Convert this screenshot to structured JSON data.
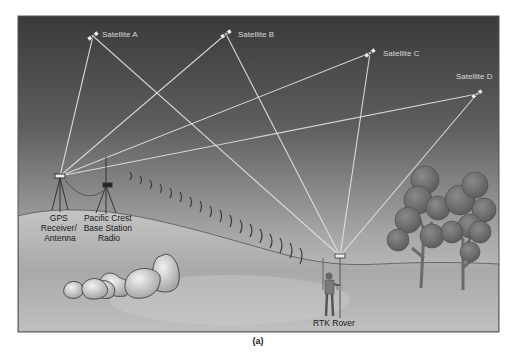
{
  "diagram": {
    "type": "RTK GPS surveying illustration",
    "caption": "(a)",
    "satellites": [
      {
        "label": "Satellite A",
        "x": 93,
        "y": 36
      },
      {
        "label": "Satellite B",
        "x": 226,
        "y": 34
      },
      {
        "label": "Satellite C",
        "x": 370,
        "y": 53
      },
      {
        "label": "Satellite D",
        "x": 477,
        "y": 94
      }
    ],
    "ground_stations": {
      "gps_receiver": {
        "label_lines": [
          "GPS",
          "Receiver/",
          "Antenna"
        ],
        "x": 60,
        "y": 176
      },
      "base_radio": {
        "label_lines": [
          "Pacific Crest",
          "Base Station",
          "Radio"
        ],
        "x": 110,
        "y": 185
      },
      "rover": {
        "label": "RTK Rover",
        "x": 340,
        "y": 256
      }
    },
    "signals": {
      "satellite_to_base": [
        "Satellite A",
        "Satellite B",
        "Satellite C",
        "Satellite D"
      ],
      "satellite_to_rover": [
        "Satellite A",
        "Satellite B",
        "Satellite C",
        "Satellite D"
      ],
      "radio_link": "Base Station Radio to RTK Rover"
    },
    "colors": {
      "sky_top": "#3a3a3a",
      "sky_bottom": "#c8c8c8",
      "ground": "#b4b4b4",
      "signal_line": "#e6e6e6",
      "tree": "#6e6e6e"
    }
  }
}
